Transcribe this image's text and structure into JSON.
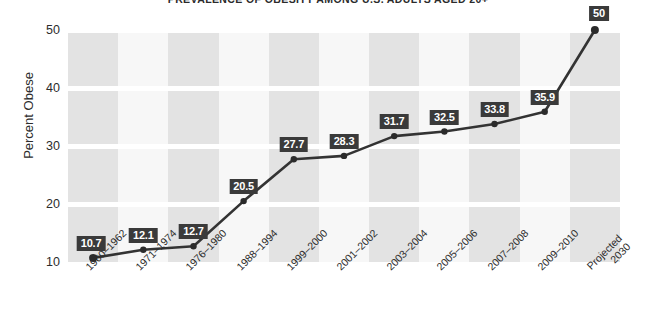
{
  "chart_data": {
    "type": "line",
    "title": "PREVALENCE OF OBESITY AMONG U.S. ADULTS AGED 20+",
    "xlabel": "",
    "ylabel": "Percent Obese",
    "ylim": [
      10,
      50
    ],
    "yticks": [
      10,
      20,
      30,
      40,
      50
    ],
    "grid": true,
    "legend": null,
    "categories": [
      "1960–1962",
      "1971–1974",
      "1976–1980",
      "1988–1994",
      "1999–2000",
      "2001–2002",
      "2003–2004",
      "2005–2006",
      "2007–2008",
      "2009–2010",
      "Projected 2030"
    ],
    "values": [
      10.7,
      12.1,
      12.7,
      20.5,
      27.7,
      28.3,
      31.7,
      32.5,
      33.8,
      35.9,
      50
    ],
    "point_labels": [
      "10.7",
      "12.1",
      "12.7",
      "20.5",
      "27.7",
      "28.3",
      "31.7",
      "32.5",
      "33.8",
      "35.9",
      "50"
    ],
    "colors": {
      "line": "#333333",
      "marker": "#2b2b2b",
      "label_badge_bg": "#3a3a3a",
      "label_badge_text": "#ffffff",
      "band_dark": "#e3e3e3",
      "band_light": "#f7f7f7",
      "gridline": "#ffffff",
      "text": "#2c2c2c",
      "background": "#ffffff"
    }
  },
  "axis": {
    "y_tick_labels": [
      "50",
      "40",
      "30",
      "20",
      "10"
    ],
    "y_title": "Percent Obese"
  }
}
